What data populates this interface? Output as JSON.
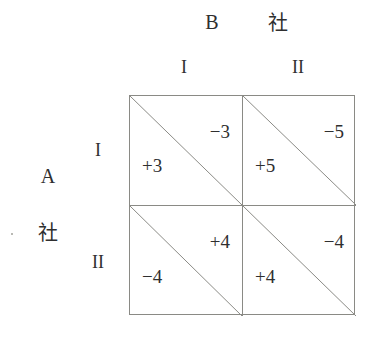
{
  "diagram": {
    "type": "payoff-matrix",
    "column_player": {
      "name": "B",
      "suffix": "社",
      "strategies": [
        "I",
        "II"
      ]
    },
    "row_player": {
      "name": "A",
      "suffix": "社",
      "strategies": [
        "I",
        "II"
      ]
    },
    "cells": [
      {
        "row": "I",
        "column": "I",
        "row_payoff": "+3",
        "column_payoff": "−3"
      },
      {
        "row": "I",
        "column": "II",
        "row_payoff": "+5",
        "column_payoff": "−5"
      },
      {
        "row": "II",
        "column": "I",
        "row_payoff": "−4",
        "column_payoff": "+4"
      },
      {
        "row": "II",
        "column": "II",
        "row_payoff": "+4",
        "column_payoff": "−4"
      }
    ],
    "colors": {
      "line": "#8a8a85",
      "text": "#2f2f2f",
      "background": "#ffffff"
    }
  }
}
